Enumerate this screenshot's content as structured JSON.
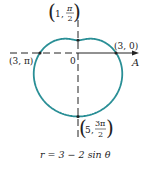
{
  "figure": {
    "equation": "r = 3 − 2 sin θ",
    "axis_label": "A",
    "pole_label": "0",
    "curve_color": "#2a8f96",
    "axis_color": "#222222",
    "points": [
      {
        "r": "3",
        "theta": "0",
        "label": "(3, 0)"
      },
      {
        "r": "1",
        "theta": "π/2",
        "label_r": "1",
        "label_num": "π",
        "label_den": "2"
      },
      {
        "r": "3",
        "theta": "π",
        "label": "(3, π)"
      },
      {
        "r": "5",
        "theta": "3π/2",
        "label_r": "5",
        "label_num": "3π",
        "label_den": "2"
      }
    ]
  }
}
